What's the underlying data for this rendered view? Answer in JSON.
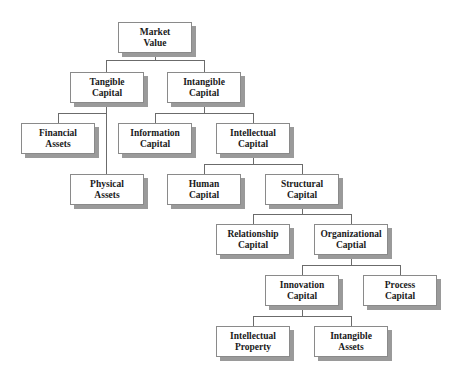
{
  "diagram": {
    "type": "hierarchy",
    "nodes": {
      "market_value": "Market\nValue",
      "tangible_capital": "Tangible\nCapital",
      "intangible_capital": "Intangible\nCapital",
      "financial_assets": "Financial\nAssets",
      "physical_assets": "Physical\nAssets",
      "information_capital": "Information\nCapital",
      "intellectual_capital": "Intellectual\nCapital",
      "human_capital": "Human\nCapital",
      "structural_capital": "Structural\nCapital",
      "relationship_capital": "Relationship\nCapital",
      "organizational_capital": "Organizational\nCaptial",
      "innovation_capital": "Innovation\nCapital",
      "process_capital": "Process\nCapital",
      "intellectual_property": "Intellectual\nProperty",
      "intangible_assets": "Intangible\nAssets"
    },
    "edges": [
      [
        "market_value",
        "tangible_capital"
      ],
      [
        "market_value",
        "intangible_capital"
      ],
      [
        "tangible_capital",
        "financial_assets"
      ],
      [
        "tangible_capital",
        "physical_assets"
      ],
      [
        "intangible_capital",
        "information_capital"
      ],
      [
        "intangible_capital",
        "intellectual_capital"
      ],
      [
        "intellectual_capital",
        "human_capital"
      ],
      [
        "intellectual_capital",
        "structural_capital"
      ],
      [
        "structural_capital",
        "relationship_capital"
      ],
      [
        "structural_capital",
        "organizational_capital"
      ],
      [
        "organizational_capital",
        "innovation_capital"
      ],
      [
        "organizational_capital",
        "process_capital"
      ],
      [
        "innovation_capital",
        "intellectual_property"
      ],
      [
        "innovation_capital",
        "intangible_assets"
      ]
    ]
  },
  "colors": {
    "box_border": "#8a8a8a",
    "box_shadow": "#9a9a9a",
    "connector": "#6b6b6b",
    "text": "#1a1a1a"
  }
}
